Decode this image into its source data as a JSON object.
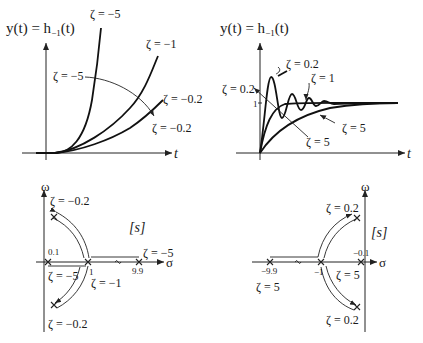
{
  "figure": {
    "top_left": {
      "title": "y(t) = h",
      "title_sub": "−1",
      "title_tail": "(t)",
      "t_label": "t",
      "labels": {
        "z_m5_top": "ζ = −5",
        "z_m1": "ζ = −1",
        "z_m5_left": "ζ = −5",
        "z_m02_right": "ζ = −0.2",
        "z_m02_bottom": "ζ = −0.2"
      }
    },
    "top_right": {
      "title": "y(t) = h",
      "title_sub": "−1",
      "title_tail": "(t)",
      "t_label": "t",
      "level_one": "1",
      "labels": {
        "z_02_top": "ζ = 0.2",
        "z_1": "ζ = 1",
        "z_02_left": "ζ = 0.2",
        "z_5_right": "ζ = 5",
        "z_5_bottom": "ζ = 5"
      }
    },
    "bottom_left": {
      "omega": "ω",
      "sigma": "σ",
      "plane": "[s]",
      "labels": {
        "z_m02_top": "ζ = −0.2",
        "z_m02_bottom": "ζ = −0.2",
        "z_m5_right": "ζ = −5",
        "z_m5_left": "ζ = −5",
        "z_m1": "ζ = −1",
        "p01": "0.1",
        "p1": "1",
        "p99": "9.9"
      }
    },
    "bottom_right": {
      "omega": "ω",
      "sigma": "σ",
      "plane": "[s]",
      "labels": {
        "z_02_top": "ζ = 0.2",
        "z_02_bottom": "ζ = 0.2",
        "z_5_right": "ζ = 5",
        "z_5_left": "ζ = 5",
        "pm01": "−0.1",
        "pm1": "−1",
        "pm99": "−9.9"
      }
    }
  }
}
